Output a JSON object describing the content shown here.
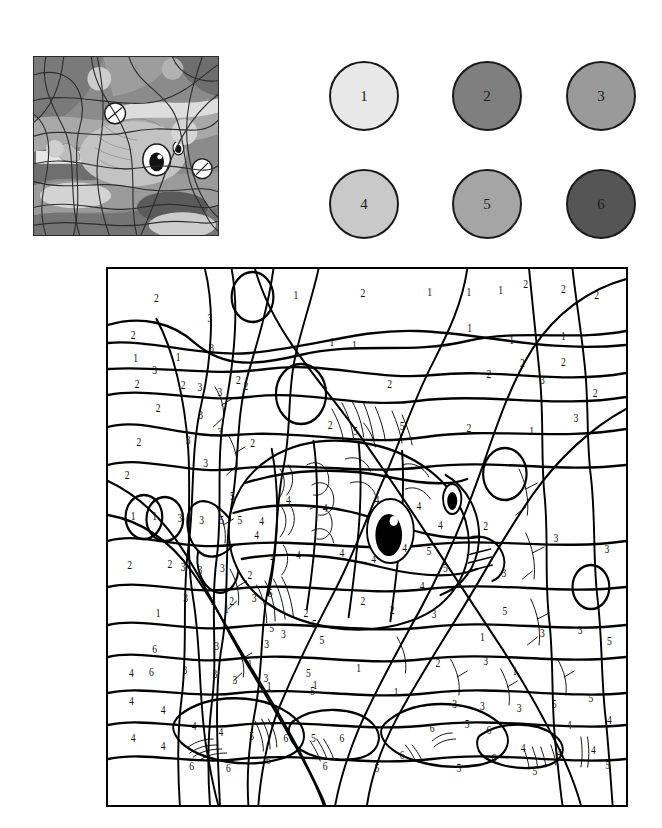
{
  "worksheet": {
    "title": "Color by Number - Fish",
    "type": "color-by-number coloring worksheet",
    "subject": "cartoon fish underwater with bubbles"
  },
  "thumbnail": {
    "name": "reference-colored-preview",
    "description": "Grayscale colored preview of the finished picture showing a cartoon fish among abstract curved shapes and bubbles",
    "border_color": "#2b2b2b"
  },
  "palette": {
    "name": "color-key",
    "swatches": [
      {
        "number": "1",
        "hex": "#e8e8e8",
        "row": 0,
        "col": 0
      },
      {
        "number": "2",
        "hex": "#7f7f7f",
        "row": 0,
        "col": 1
      },
      {
        "number": "3",
        "hex": "#9a9a9a",
        "row": 0,
        "col": 2
      },
      {
        "number": "4",
        "hex": "#c9c9c9",
        "row": 1,
        "col": 0
      },
      {
        "number": "5",
        "hex": "#a5a5a5",
        "row": 1,
        "col": 1
      },
      {
        "number": "6",
        "hex": "#555555",
        "row": 1,
        "col": 2
      }
    ]
  },
  "board": {
    "name": "coloring-canvas",
    "border_color": "#000000",
    "background": "#ffffff",
    "region_numbers": [
      {
        "n": "2",
        "x": 58,
        "y": 30
      },
      {
        "n": "1",
        "x": 225,
        "y": 27
      },
      {
        "n": "2",
        "x": 305,
        "y": 25
      },
      {
        "n": "1",
        "x": 385,
        "y": 24
      },
      {
        "n": "1",
        "x": 432,
        "y": 24
      },
      {
        "n": "1",
        "x": 470,
        "y": 22
      },
      {
        "n": "2",
        "x": 500,
        "y": 16
      },
      {
        "n": "2",
        "x": 545,
        "y": 21
      },
      {
        "n": "2",
        "x": 585,
        "y": 27
      },
      {
        "n": "3",
        "x": 122,
        "y": 50
      },
      {
        "n": "2",
        "x": 30,
        "y": 67
      },
      {
        "n": "1",
        "x": 268,
        "y": 74
      },
      {
        "n": "1",
        "x": 433,
        "y": 60
      },
      {
        "n": "1",
        "x": 483,
        "y": 72
      },
      {
        "n": "1",
        "x": 545,
        "y": 68
      },
      {
        "n": "1",
        "x": 33,
        "y": 90
      },
      {
        "n": "1",
        "x": 84,
        "y": 89
      },
      {
        "n": "3",
        "x": 124,
        "y": 80
      },
      {
        "n": "3",
        "x": 56,
        "y": 102
      },
      {
        "n": "1",
        "x": 295,
        "y": 77
      },
      {
        "n": "2",
        "x": 496,
        "y": 95
      },
      {
        "n": "2",
        "x": 545,
        "y": 94
      },
      {
        "n": "2",
        "x": 35,
        "y": 116
      },
      {
        "n": "2",
        "x": 90,
        "y": 117
      },
      {
        "n": "3",
        "x": 110,
        "y": 119
      },
      {
        "n": "3",
        "x": 134,
        "y": 124
      },
      {
        "n": "2",
        "x": 156,
        "y": 112
      },
      {
        "n": "2",
        "x": 456,
        "y": 106
      },
      {
        "n": "3",
        "x": 520,
        "y": 112
      },
      {
        "n": "2",
        "x": 583,
        "y": 125
      },
      {
        "n": "2",
        "x": 60,
        "y": 140
      },
      {
        "n": "3",
        "x": 111,
        "y": 147
      },
      {
        "n": "3",
        "x": 134,
        "y": 164
      },
      {
        "n": "2",
        "x": 165,
        "y": 118
      },
      {
        "n": "2",
        "x": 337,
        "y": 116
      },
      {
        "n": "2",
        "x": 173,
        "y": 175
      },
      {
        "n": "2",
        "x": 37,
        "y": 174
      },
      {
        "n": "3",
        "x": 96,
        "y": 172
      },
      {
        "n": "3",
        "x": 117,
        "y": 195
      },
      {
        "n": "2",
        "x": 266,
        "y": 157
      },
      {
        "n": "5",
        "x": 296,
        "y": 163
      },
      {
        "n": "5",
        "x": 352,
        "y": 158
      },
      {
        "n": "2",
        "x": 432,
        "y": 160
      },
      {
        "n": "1",
        "x": 507,
        "y": 163
      },
      {
        "n": "3",
        "x": 560,
        "y": 150
      },
      {
        "n": "2",
        "x": 23,
        "y": 207
      },
      {
        "n": "1",
        "x": 30,
        "y": 248
      },
      {
        "n": "1",
        "x": 56,
        "y": 248
      },
      {
        "n": "3",
        "x": 86,
        "y": 250
      },
      {
        "n": "3",
        "x": 112,
        "y": 252
      },
      {
        "n": "5",
        "x": 136,
        "y": 252
      },
      {
        "n": "5",
        "x": 158,
        "y": 252
      },
      {
        "n": "4",
        "x": 184,
        "y": 253
      },
      {
        "n": "5",
        "x": 149,
        "y": 228
      },
      {
        "n": "4",
        "x": 216,
        "y": 232
      },
      {
        "n": "4",
        "x": 260,
        "y": 240
      },
      {
        "n": "4",
        "x": 322,
        "y": 232
      },
      {
        "n": "4",
        "x": 372,
        "y": 238
      },
      {
        "n": "4",
        "x": 398,
        "y": 257
      },
      {
        "n": "4",
        "x": 355,
        "y": 280
      },
      {
        "n": "4",
        "x": 318,
        "y": 291
      },
      {
        "n": "2",
        "x": 452,
        "y": 258
      },
      {
        "n": "3",
        "x": 536,
        "y": 270
      },
      {
        "n": "3",
        "x": 597,
        "y": 281
      },
      {
        "n": "3",
        "x": 90,
        "y": 299
      },
      {
        "n": "3",
        "x": 110,
        "y": 302
      },
      {
        "n": "3",
        "x": 137,
        "y": 300
      },
      {
        "n": "2",
        "x": 26,
        "y": 297
      },
      {
        "n": "2",
        "x": 74,
        "y": 296
      },
      {
        "n": "4",
        "x": 197,
        "y": 290
      },
      {
        "n": "4",
        "x": 178,
        "y": 267
      },
      {
        "n": "4",
        "x": 228,
        "y": 287
      },
      {
        "n": "2",
        "x": 170,
        "y": 307
      },
      {
        "n": "4",
        "x": 280,
        "y": 285
      },
      {
        "n": "5",
        "x": 384,
        "y": 283
      },
      {
        "n": "5",
        "x": 404,
        "y": 300
      },
      {
        "n": "4",
        "x": 376,
        "y": 318
      },
      {
        "n": "2",
        "x": 305,
        "y": 333
      },
      {
        "n": "3",
        "x": 93,
        "y": 330
      },
      {
        "n": "3",
        "x": 126,
        "y": 333
      },
      {
        "n": "2",
        "x": 148,
        "y": 333
      },
      {
        "n": "3",
        "x": 175,
        "y": 330
      },
      {
        "n": "5",
        "x": 194,
        "y": 325
      },
      {
        "n": "1",
        "x": 60,
        "y": 345
      },
      {
        "n": "1",
        "x": 142,
        "y": 341
      },
      {
        "n": "2",
        "x": 237,
        "y": 345
      },
      {
        "n": "2",
        "x": 340,
        "y": 342
      },
      {
        "n": "3",
        "x": 390,
        "y": 346
      },
      {
        "n": "5",
        "x": 196,
        "y": 360
      },
      {
        "n": "5",
        "x": 247,
        "y": 356
      },
      {
        "n": "3",
        "x": 474,
        "y": 305
      },
      {
        "n": "5",
        "x": 475,
        "y": 343
      },
      {
        "n": "1",
        "x": 448,
        "y": 369
      },
      {
        "n": "3",
        "x": 520,
        "y": 365
      },
      {
        "n": "3",
        "x": 565,
        "y": 362
      },
      {
        "n": "5",
        "x": 600,
        "y": 373
      },
      {
        "n": "6",
        "x": 56,
        "y": 381
      },
      {
        "n": "3",
        "x": 130,
        "y": 378
      },
      {
        "n": "3",
        "x": 190,
        "y": 376
      },
      {
        "n": "3",
        "x": 210,
        "y": 366
      },
      {
        "n": "5",
        "x": 256,
        "y": 372
      },
      {
        "n": "1",
        "x": 170,
        "y": 396
      },
      {
        "n": "1",
        "x": 300,
        "y": 400
      },
      {
        "n": "2",
        "x": 395,
        "y": 395
      },
      {
        "n": "3",
        "x": 452,
        "y": 393
      },
      {
        "n": "1",
        "x": 487,
        "y": 403
      },
      {
        "n": "4",
        "x": 28,
        "y": 405
      },
      {
        "n": "6",
        "x": 52,
        "y": 404
      },
      {
        "n": "3",
        "x": 92,
        "y": 402
      },
      {
        "n": "3",
        "x": 128,
        "y": 406
      },
      {
        "n": "3",
        "x": 152,
        "y": 412
      },
      {
        "n": "3",
        "x": 189,
        "y": 410
      },
      {
        "n": "5",
        "x": 240,
        "y": 405
      },
      {
        "n": "5",
        "x": 245,
        "y": 423
      },
      {
        "n": "1",
        "x": 193,
        "y": 418
      },
      {
        "n": "1",
        "x": 248,
        "y": 417
      },
      {
        "n": "1",
        "x": 345,
        "y": 424
      },
      {
        "n": "3",
        "x": 415,
        "y": 436
      },
      {
        "n": "3",
        "x": 448,
        "y": 438
      },
      {
        "n": "3",
        "x": 492,
        "y": 440
      },
      {
        "n": "5",
        "x": 534,
        "y": 436
      },
      {
        "n": "5",
        "x": 578,
        "y": 430
      },
      {
        "n": "4",
        "x": 28,
        "y": 433
      },
      {
        "n": "4",
        "x": 66,
        "y": 442
      },
      {
        "n": "5",
        "x": 430,
        "y": 456
      },
      {
        "n": "4",
        "x": 552,
        "y": 457
      },
      {
        "n": "4",
        "x": 600,
        "y": 452
      },
      {
        "n": "6",
        "x": 388,
        "y": 460
      },
      {
        "n": "6",
        "x": 456,
        "y": 462
      },
      {
        "n": "4",
        "x": 103,
        "y": 458
      },
      {
        "n": "4",
        "x": 135,
        "y": 464
      },
      {
        "n": "5",
        "x": 172,
        "y": 468
      },
      {
        "n": "6",
        "x": 213,
        "y": 470
      },
      {
        "n": "5",
        "x": 246,
        "y": 470
      },
      {
        "n": "6",
        "x": 280,
        "y": 470
      },
      {
        "n": "4",
        "x": 497,
        "y": 480
      },
      {
        "n": "4",
        "x": 540,
        "y": 485
      },
      {
        "n": "4",
        "x": 581,
        "y": 482
      },
      {
        "n": "4",
        "x": 30,
        "y": 470
      },
      {
        "n": "4",
        "x": 66,
        "y": 478
      },
      {
        "n": "6",
        "x": 192,
        "y": 492
      },
      {
        "n": "6",
        "x": 144,
        "y": 500
      },
      {
        "n": "6",
        "x": 100,
        "y": 498
      },
      {
        "n": "6",
        "x": 260,
        "y": 498
      },
      {
        "n": "5",
        "x": 322,
        "y": 500
      },
      {
        "n": "6",
        "x": 352,
        "y": 487
      },
      {
        "n": "5",
        "x": 420,
        "y": 500
      },
      {
        "n": "6",
        "x": 462,
        "y": 490
      },
      {
        "n": "5",
        "x": 511,
        "y": 503
      },
      {
        "n": "5",
        "x": 598,
        "y": 497
      }
    ]
  }
}
